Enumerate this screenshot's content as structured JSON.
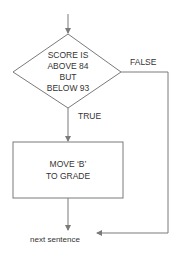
{
  "diagram": {
    "type": "flowchart",
    "decision": {
      "lines": [
        "SCORE IS",
        "ABOVE 84",
        "BUT",
        "BELOW 93"
      ]
    },
    "branches": {
      "false_label": "FALSE",
      "true_label": "TRUE"
    },
    "process": {
      "lines": [
        "MOVE ‘B’",
        "TO GRADE"
      ]
    },
    "terminal": {
      "label": "next sentence"
    },
    "colors": {
      "line": "#7a7a7a",
      "text": "#333333"
    }
  }
}
